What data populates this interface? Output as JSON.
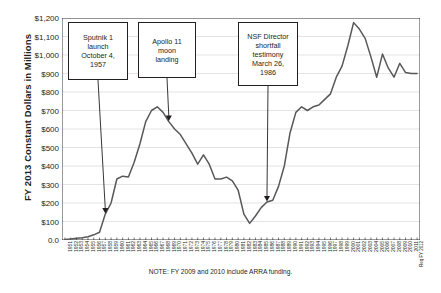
{
  "figure": {
    "note": "NOTE: FY 2009 and 2010 include ARRA funding.",
    "line_color": "#58585b",
    "grid_color": "#d9d9d9",
    "axis_color": "#231f20"
  },
  "annotations": [
    {
      "id": "sputnik",
      "lines": [
        "Sputnik 1",
        "launch",
        "October 4,",
        "1957"
      ],
      "target_year": 1958
    },
    {
      "id": "apollo",
      "lines": [
        "Apollo 11",
        "moon",
        "landing"
      ],
      "target_year": 1969
    },
    {
      "id": "nsf-testimony",
      "lines": [
        "NSF Director",
        "shortfall",
        "testimony",
        "March 26,",
        "1986"
      ],
      "target_year": 1986
    }
  ],
  "chart_data": {
    "type": "line",
    "title": "",
    "xlabel": "",
    "ylabel": "FY 2013 Constant Dollars in Millions",
    "ylim": [
      0,
      1200
    ],
    "ytick_labels": [
      "$1,200",
      "$1,100",
      "$1,000",
      "$900",
      "$800",
      "$700",
      "$600",
      "$500",
      "$400",
      "$300",
      "$200",
      "$100",
      "0.0"
    ],
    "ytick_values": [
      1200,
      1100,
      1000,
      900,
      800,
      700,
      600,
      500,
      400,
      300,
      200,
      100,
      0
    ],
    "grid": true,
    "legend": "none",
    "categories": [
      "1951",
      "1952",
      "1953",
      "1954",
      "1955",
      "1956",
      "1957",
      "1958",
      "1959",
      "1960",
      "1961",
      "1962",
      "1963",
      "1964",
      "1965",
      "1966",
      "1967",
      "1968",
      "1969",
      "1970",
      "1971",
      "1972",
      "1973",
      "1974",
      "1975",
      "1976",
      "1977",
      "1978",
      "1979",
      "1980",
      "1981",
      "1982",
      "1983",
      "1984",
      "1985",
      "1986",
      "1987",
      "1988",
      "1989",
      "1990",
      "1991",
      "1992",
      "1993",
      "1994",
      "1995",
      "1996",
      "1997",
      "1998",
      "1999",
      "2000",
      "2001",
      "2002",
      "2003",
      "2004",
      "2005",
      "2006",
      "2007",
      "2008",
      "2009",
      "2010",
      "2011",
      "Req FY 2012"
    ],
    "values": [
      3,
      6,
      9,
      12,
      18,
      28,
      42,
      140,
      200,
      330,
      345,
      340,
      420,
      520,
      640,
      700,
      720,
      690,
      640,
      600,
      570,
      520,
      470,
      410,
      460,
      410,
      330,
      330,
      340,
      320,
      270,
      140,
      90,
      130,
      175,
      205,
      215,
      290,
      400,
      580,
      690,
      720,
      700,
      720,
      730,
      760,
      790,
      880,
      940,
      1050,
      1175,
      1140,
      1090,
      990,
      880,
      1005,
      930,
      880,
      955,
      905,
      900,
      900
    ]
  }
}
